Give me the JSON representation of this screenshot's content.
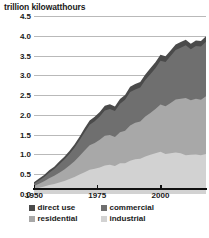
{
  "chart_data": {
    "type": "area",
    "title": "trillion kilowatthours",
    "subtitle": "",
    "xlabel": "",
    "ylabel": "trillion kilowatthours",
    "stacked": true,
    "grid": true,
    "legend_position": "bottom",
    "xlim": [
      1950,
      2018
    ],
    "ylim": [
      0.0,
      4.5
    ],
    "ytick_labels": [
      "4.5",
      "4.0",
      "3.5",
      "3.0",
      "2.5",
      "2.0",
      "1.5",
      "1.0",
      "0.5",
      "0.0"
    ],
    "ytick_values": [
      4.5,
      4.0,
      3.5,
      3.0,
      2.5,
      2.0,
      1.5,
      1.0,
      0.5,
      0.0
    ],
    "xtick_labels": [
      "1950",
      "1975",
      "2000"
    ],
    "xtick_values": [
      1950,
      1975,
      2000
    ],
    "x": [
      1950,
      1952,
      1954,
      1956,
      1958,
      1960,
      1962,
      1964,
      1966,
      1968,
      1970,
      1972,
      1974,
      1976,
      1978,
      1980,
      1982,
      1984,
      1986,
      1988,
      1990,
      1992,
      1994,
      1996,
      1998,
      2000,
      2002,
      2004,
      2006,
      2008,
      2010,
      2012,
      2014,
      2016,
      2018
    ],
    "series": [
      {
        "name": "industrial",
        "color": "#d2d2d2",
        "values": [
          0.13,
          0.16,
          0.19,
          0.23,
          0.25,
          0.29,
          0.33,
          0.38,
          0.43,
          0.49,
          0.55,
          0.61,
          0.64,
          0.67,
          0.72,
          0.74,
          0.71,
          0.78,
          0.78,
          0.84,
          0.88,
          0.89,
          0.95,
          0.99,
          1.03,
          1.07,
          1.01,
          1.03,
          1.05,
          1.03,
          0.98,
          0.99,
          1.0,
          0.98,
          1.01
        ]
      },
      {
        "name": "residential",
        "color": "#a8a8a8",
        "values": [
          0.07,
          0.1,
          0.13,
          0.17,
          0.21,
          0.25,
          0.29,
          0.34,
          0.4,
          0.47,
          0.55,
          0.62,
          0.65,
          0.7,
          0.75,
          0.75,
          0.73,
          0.78,
          0.82,
          0.89,
          0.92,
          0.94,
          1.01,
          1.06,
          1.12,
          1.19,
          1.21,
          1.27,
          1.34,
          1.38,
          1.45,
          1.38,
          1.41,
          1.4,
          1.46
        ]
      },
      {
        "name": "commercial",
        "color": "#6f6f6f",
        "values": [
          0.06,
          0.08,
          0.11,
          0.14,
          0.17,
          0.21,
          0.25,
          0.29,
          0.34,
          0.4,
          0.46,
          0.52,
          0.55,
          0.59,
          0.64,
          0.66,
          0.66,
          0.72,
          0.78,
          0.85,
          0.84,
          0.86,
          0.92,
          0.98,
          1.03,
          1.11,
          1.12,
          1.19,
          1.25,
          1.29,
          1.33,
          1.29,
          1.33,
          1.35,
          1.38
        ]
      },
      {
        "name": "direct use",
        "color": "#4a4a4a",
        "values": [
          0.04,
          0.05,
          0.05,
          0.06,
          0.06,
          0.07,
          0.07,
          0.08,
          0.08,
          0.09,
          0.1,
          0.11,
          0.11,
          0.11,
          0.12,
          0.12,
          0.11,
          0.12,
          0.12,
          0.13,
          0.14,
          0.14,
          0.14,
          0.15,
          0.15,
          0.15,
          0.14,
          0.14,
          0.14,
          0.14,
          0.14,
          0.14,
          0.14,
          0.14,
          0.14
        ]
      }
    ],
    "totals": [
      0.3,
      0.39,
      0.48,
      0.6,
      0.69,
      0.82,
      0.94,
      1.09,
      1.25,
      1.45,
      1.66,
      1.86,
      1.95,
      2.07,
      2.23,
      2.27,
      2.21,
      2.4,
      2.5,
      2.71,
      2.78,
      2.83,
      3.02,
      3.18,
      3.33,
      3.52,
      3.48,
      3.63,
      3.78,
      3.84,
      3.9,
      3.8,
      3.88,
      3.87,
      3.99
    ]
  },
  "legend": {
    "items": [
      {
        "label": "direct use",
        "swatch_color": "#4a4a4a"
      },
      {
        "label": "commercial",
        "swatch_color": "#6f6f6f"
      },
      {
        "label": "residential",
        "swatch_color": "#a8a8a8"
      },
      {
        "label": "industrial",
        "swatch_color": "#d2d2d2"
      }
    ]
  },
  "axes": {
    "grid_color": "#b9b9b9",
    "axis_color": "#111111",
    "text_color": "#1a1a1a"
  }
}
